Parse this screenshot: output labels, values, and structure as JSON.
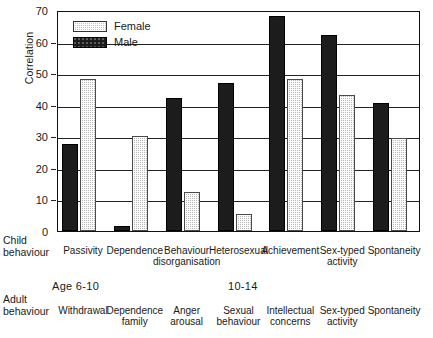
{
  "chart_data": {
    "type": "bar",
    "title": "",
    "subtitle": "",
    "ylabel": "Correlation",
    "xlabel": "",
    "ylim": [
      0,
      70
    ],
    "yticks": [
      0,
      10,
      20,
      30,
      40,
      50,
      60,
      70
    ],
    "grid": true,
    "legend_position": "top-left",
    "categories": [
      "Passivity",
      "Dependence",
      "Behaviour disorganisation",
      "Heterosexual",
      "Achievement",
      "Sex-typed activity",
      "Spontaneity"
    ],
    "series": [
      {
        "name": "Female",
        "color": "#c3c3c3",
        "values": [
          48,
          30,
          12.5,
          5.5,
          48,
          43,
          29.5
        ]
      },
      {
        "name": "Male",
        "color": "#1c1c1c",
        "values": [
          27.5,
          1.5,
          42,
          47,
          68,
          62,
          40.5
        ]
      }
    ]
  },
  "legend": {
    "items": [
      {
        "label": "Female",
        "swatch": "female-swatch-icon"
      },
      {
        "label": "Male",
        "swatch": "male-swatch-icon"
      }
    ]
  },
  "axes": {
    "y_title": "Correlation",
    "y_ticks": [
      "70",
      "60",
      "50",
      "40",
      "30",
      "20",
      "10",
      "0"
    ]
  },
  "rows": {
    "child_behaviour_label_line1": "Child",
    "child_behaviour_label_line2": "behaviour",
    "adult_behaviour_label_line1": "Adult",
    "adult_behaviour_label_line2": "behaviour",
    "child_behaviours": [
      {
        "line1": "Passivity",
        "line2": ""
      },
      {
        "line1": "Dependence",
        "line2": ""
      },
      {
        "line1": "Behaviour",
        "line2": "disorganisation"
      },
      {
        "line1": "Heterosexual",
        "line2": ""
      },
      {
        "line1": "Achievement",
        "line2": ""
      },
      {
        "line1": "Sex-typed",
        "line2": "activity"
      },
      {
        "line1": "Spontaneity",
        "line2": ""
      }
    ],
    "adult_behaviours": [
      {
        "line1": "Withdrawal",
        "line2": ""
      },
      {
        "line1": "Dependence",
        "line2": "family"
      },
      {
        "line1": "Anger",
        "line2": "arousal"
      },
      {
        "line1": "Sexual",
        "line2": "behaviour"
      },
      {
        "line1": "Intellectual",
        "line2": "concerns"
      },
      {
        "line1": "Sex-typed",
        "line2": "activity"
      },
      {
        "line1": "Spontaneity",
        "line2": ""
      }
    ],
    "age_groups": [
      {
        "label": "Age 6-10"
      },
      {
        "label": "10-14"
      }
    ]
  }
}
